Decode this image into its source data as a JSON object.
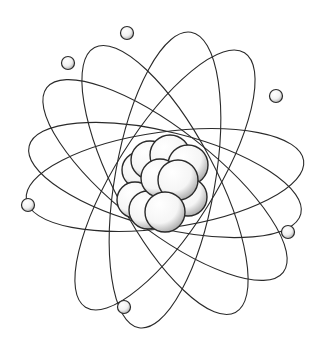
{
  "illustration": {
    "title": "Atom model illustration",
    "subject": "atom with nucleus and orbiting electrons",
    "colors": {
      "background": "#ffffff",
      "line": "#2a2a2a",
      "shade": "#9a9a9a",
      "fill": "#ffffff"
    },
    "center": [
      165,
      180
    ],
    "orbits": [
      {
        "rx": 140,
        "ry": 48,
        "rotate": -8
      },
      {
        "rx": 140,
        "ry": 48,
        "rotate": 14
      },
      {
        "rx": 150,
        "ry": 50,
        "rotate": 38
      },
      {
        "rx": 150,
        "ry": 50,
        "rotate": 62
      },
      {
        "rx": 150,
        "ry": 50,
        "rotate": 100
      },
      {
        "rx": 150,
        "ry": 50,
        "rotate": 122
      }
    ],
    "electrons": [
      {
        "x": 127,
        "y": 33
      },
      {
        "x": 68,
        "y": 63
      },
      {
        "x": 276,
        "y": 96
      },
      {
        "x": 28,
        "y": 205
      },
      {
        "x": 288,
        "y": 232
      },
      {
        "x": 124,
        "y": 307
      }
    ],
    "nucleons": [
      {
        "x": 140,
        "y": 170,
        "r": 18
      },
      {
        "x": 150,
        "y": 160,
        "r": 19
      },
      {
        "x": 170,
        "y": 155,
        "r": 20
      },
      {
        "x": 188,
        "y": 165,
        "r": 20
      },
      {
        "x": 135,
        "y": 200,
        "r": 18
      },
      {
        "x": 148,
        "y": 210,
        "r": 19
      },
      {
        "x": 188,
        "y": 197,
        "r": 19
      },
      {
        "x": 160,
        "y": 178,
        "r": 19
      },
      {
        "x": 178,
        "y": 180,
        "r": 20
      },
      {
        "x": 165,
        "y": 212,
        "r": 20
      }
    ]
  }
}
